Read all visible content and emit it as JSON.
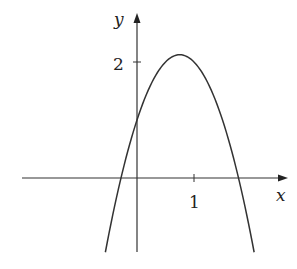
{
  "chart_data": {
    "type": "line",
    "title": "",
    "xlabel": "x",
    "ylabel": "y",
    "x_ticks": [
      {
        "value": 1,
        "label": "1"
      }
    ],
    "y_ticks": [
      {
        "value": 2,
        "label": "2"
      }
    ],
    "xlim": [
      -2.03,
      2.65
    ],
    "ylim": [
      -1.28,
      2.84
    ],
    "grid": false,
    "legend": null,
    "series": [
      {
        "name": "f(x)",
        "description": "downward-opening parabola, approx. y = 1 + 3x - 2x^2",
        "x": [
          -0.555,
          -0.28,
          0,
          0.25,
          0.5,
          0.75,
          1.0,
          1.25,
          1.5,
          1.78,
          2.055
        ],
        "y": [
          -1.28,
          0,
          1.0,
          1.625,
          2.0,
          2.125,
          2.0,
          1.625,
          1.0,
          0,
          -1.28
        ]
      }
    ],
    "key_points": {
      "y_intercept": 1.0,
      "x_intercepts": [
        -0.28,
        1.78
      ],
      "vertex": [
        0.75,
        2.125
      ]
    }
  },
  "labels": {
    "x_axis": "x",
    "y_axis": "y",
    "x_tick_1": "1",
    "y_tick_2": "2"
  },
  "colors": {
    "line": "#333333",
    "axis": "#333333",
    "background": "#ffffff"
  }
}
